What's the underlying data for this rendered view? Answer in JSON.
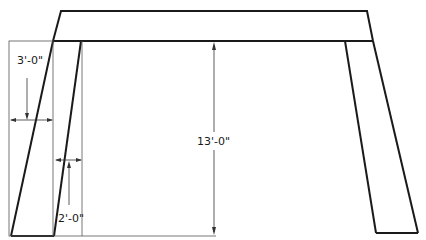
{
  "diagram": {
    "type": "structural elevation (bent frame with battered legs)",
    "colors": {
      "line": "#1a1a1a",
      "thin_line": "#555555",
      "background": "#ffffff"
    },
    "dimensions": {
      "height": "13'-0\"",
      "leg_top_width": "2'-0\"",
      "leg_bottom_batter": "3'-0\""
    }
  }
}
